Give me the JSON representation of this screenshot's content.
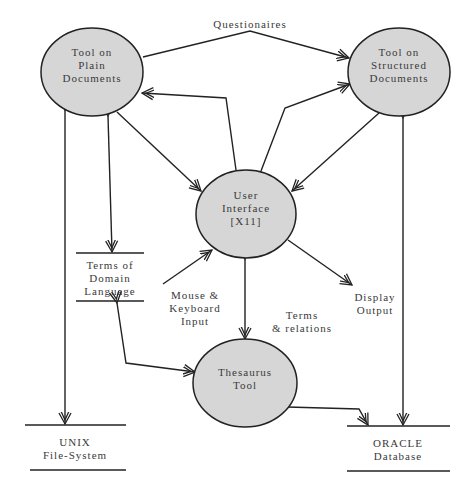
{
  "diagram": {
    "type": "data-flow-diagram",
    "colors": {
      "process_fill": "#d6d6d6",
      "stroke": "#222222",
      "text": "#3a3a3a",
      "background": "#ffffff"
    },
    "processes": [
      {
        "id": "plain",
        "label": "Tool on\nPlain\nDocuments"
      },
      {
        "id": "structured",
        "label": "Tool on\nStructured\nDocuments"
      },
      {
        "id": "ui",
        "label": "User\nInterface\n[X11]"
      },
      {
        "id": "thesaurus",
        "label": "Thesaurus\nTool"
      }
    ],
    "stores": [
      {
        "id": "domain",
        "label": "Terms of\nDomain\nLanguage"
      },
      {
        "id": "unix",
        "label": "UNIX\nFile-System"
      },
      {
        "id": "oracle",
        "label": "ORACLE\nDatabase"
      }
    ],
    "flow_labels": {
      "questionaires": "Questionaires",
      "mouse_keyboard": "Mouse &\nKeyboard\nInput",
      "terms_relations": "Terms\n& relations",
      "display_output": "Display\nOutput"
    },
    "flows": [
      {
        "from": "plain",
        "to": "structured",
        "label": "Questionaires"
      },
      {
        "from": "plain",
        "to": "ui"
      },
      {
        "from": "ui",
        "to": "plain"
      },
      {
        "from": "ui",
        "to": "structured"
      },
      {
        "from": "structured",
        "to": "ui"
      },
      {
        "from": "plain",
        "to": "domain",
        "bidirectional": true
      },
      {
        "from": "plain",
        "to": "unix",
        "bidirectional": true
      },
      {
        "from": "structured",
        "to": "oracle",
        "bidirectional": true
      },
      {
        "from": "mouse_keyboard",
        "to": "ui"
      },
      {
        "from": "ui",
        "to": "display_output"
      },
      {
        "from": "ui",
        "to": "thesaurus",
        "label": "Terms & relations",
        "bidirectional": true
      },
      {
        "from": "domain",
        "to": "thesaurus",
        "bidirectional": true
      },
      {
        "from": "thesaurus",
        "to": "oracle",
        "bidirectional": true
      }
    ]
  }
}
